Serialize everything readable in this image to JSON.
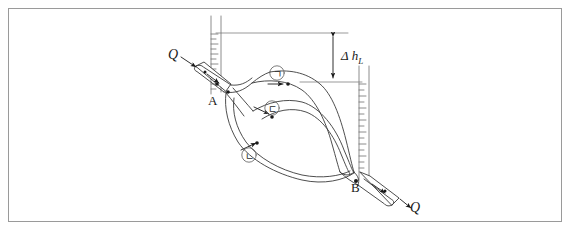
{
  "figure": {
    "border_color": "#9a9a9a",
    "line_color": "#3a3a3a",
    "background": "#ffffff"
  },
  "labels": {
    "inlet_flow": "Q",
    "outlet_flow": "Q",
    "junction_a": "A",
    "junction_b": "B",
    "head_loss": "Δ h",
    "head_loss_sub": "L"
  },
  "branches": [
    {
      "id": "branch-1",
      "label": "ㄱ",
      "name": "upper-branch"
    },
    {
      "id": "branch-3",
      "label": "ㄷ",
      "name": "middle-branch"
    },
    {
      "id": "branch-2",
      "label": "ㄴ",
      "name": "lower-branch"
    }
  ],
  "manometers": [
    {
      "name": "piezometer-tube-a",
      "ticks": 12
    },
    {
      "name": "piezometer-tube-b",
      "ticks": 13
    }
  ],
  "icons": {
    "flow_arrow": "flow-arrow-icon",
    "dimension_arrow": "dimension-arrow-icon",
    "node_dot": "node-dot-icon"
  }
}
